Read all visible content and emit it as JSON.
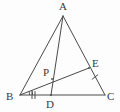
{
  "figure": {
    "kind": "geometry-diagram",
    "background_color": "#fdfdfd",
    "stroke_color": "#4a4a4a",
    "label_color": "#3a3a3a",
    "stroke_width": 1,
    "points": [
      {
        "id": "A",
        "label": "A",
        "x": 63,
        "y": 16,
        "label_x": 59,
        "label_y": 1
      },
      {
        "id": "B",
        "label": "B",
        "x": 20,
        "y": 95,
        "label_x": 6,
        "label_y": 91
      },
      {
        "id": "C",
        "label": "C",
        "x": 105,
        "y": 95,
        "label_x": 107,
        "label_y": 91
      },
      {
        "id": "D",
        "label": "D",
        "x": 51,
        "y": 95,
        "label_x": 46,
        "label_y": 99
      },
      {
        "id": "E",
        "label": "E",
        "x": 89,
        "y": 68,
        "label_x": 92,
        "label_y": 58
      },
      {
        "id": "P",
        "label": "P",
        "x": 52,
        "y": 79,
        "label_x": 43,
        "label_y": 67
      }
    ],
    "segments": [
      {
        "id": "AB",
        "from": "A",
        "to": "B",
        "name": "side-ab"
      },
      {
        "id": "AC",
        "from": "A",
        "to": "C",
        "name": "side-ac"
      },
      {
        "id": "BC",
        "from": "B",
        "to": "C",
        "name": "side-bc"
      },
      {
        "id": "AD",
        "from": "A",
        "to": "D",
        "name": "cevian-ad"
      },
      {
        "id": "BE",
        "from": "B",
        "to": "E",
        "name": "cevian-be"
      }
    ],
    "tick_marks": [
      {
        "id": "tick-bd",
        "on_segment": "BD",
        "count": 2,
        "x": 33,
        "y": 95
      },
      {
        "id": "tick-ec",
        "on_segment": "EC",
        "count": 1,
        "x": 95,
        "y": 77
      }
    ],
    "angle_marks": [
      {
        "id": "angle-abe",
        "at_vertex": "B",
        "count": 2,
        "note": "angle bisector marks at B"
      }
    ]
  }
}
